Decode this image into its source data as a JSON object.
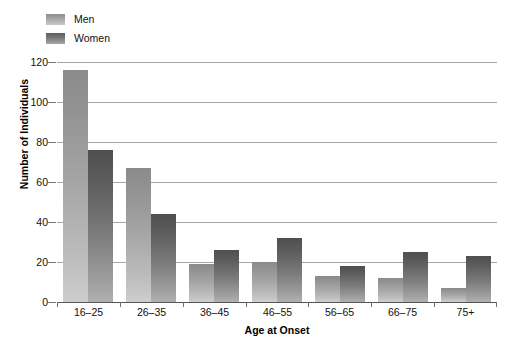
{
  "chart_data": {
    "type": "bar",
    "title": "",
    "subtitle": "",
    "xlabel": "Age at Onset",
    "ylabel": "Number of Individuals",
    "categories": [
      "16–25",
      "26–35",
      "36–45",
      "46–55",
      "56–65",
      "66–75",
      "75+"
    ],
    "series": [
      {
        "name": "Men",
        "values": [
          116,
          67,
          19,
          20,
          13,
          12,
          7
        ],
        "color": "#a5a5a5"
      },
      {
        "name": "Women",
        "values": [
          76,
          44,
          26,
          32,
          18,
          25,
          23
        ],
        "color": "#6e6e6e"
      }
    ],
    "ylim": [
      0,
      120
    ],
    "yticks": [
      0,
      20,
      40,
      60,
      80,
      100,
      120
    ],
    "ytick_labels": [
      "0",
      "20",
      "40",
      "60",
      "80",
      "100",
      "120"
    ],
    "grid": true,
    "grid_axis": "y",
    "legend_position": "top-left",
    "annotations": []
  },
  "legend": {
    "items": [
      {
        "label": "Men",
        "swatch": "men-swatch-icon"
      },
      {
        "label": "Women",
        "swatch": "women-swatch-icon"
      }
    ]
  },
  "axes": {
    "y_title": "Number of Individuals",
    "x_title": "Age at Onset"
  },
  "footer": {
    "note": ""
  }
}
